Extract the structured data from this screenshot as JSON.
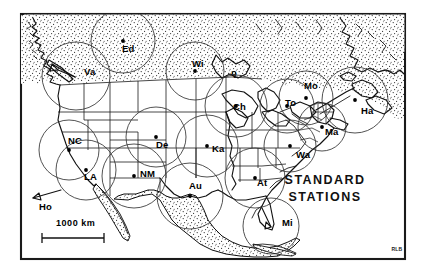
{
  "figure": {
    "title": "STANDARD",
    "title_line2": "STATIONS",
    "signature": "RLB",
    "scale_label": "1000 km",
    "offmap_label": "Ho",
    "canada_marker_label": "Q"
  },
  "chart_data": {
    "type": "scatter",
    "title": "STANDARD STATIONS",
    "xlabel": "",
    "ylabel": "",
    "projection": "North America, stippled = outside United States",
    "annotations": [
      "STANDARD",
      "STATIONS",
      "1000 km",
      "Ho",
      "RLB"
    ],
    "legend": [],
    "grid": false,
    "marker_note": "Each station is a filled dot with a circle of equal radius drawn around it (coverage radius ~ 500 km).",
    "categories": [
      "Va",
      "Ed",
      "Wi",
      "Mo",
      "To",
      "Ha",
      "Ma",
      "Ch",
      "NC",
      "De",
      "Ka",
      "Wa",
      "LA",
      "NM",
      "Au",
      "At",
      "Mi",
      "Ho"
    ],
    "stations": [
      {
        "code": "Va",
        "x": 76,
        "y": 76,
        "label_dx": 8,
        "label_dy": -1,
        "circle_r": 34,
        "has_dot": false,
        "has_arrow": true
      },
      {
        "code": "Ed",
        "x": 123,
        "y": 41,
        "label_dx": -1,
        "label_dy": 11,
        "circle_r": 32,
        "has_dot": true,
        "has_arrow": false
      },
      {
        "code": "Wi",
        "x": 195,
        "y": 71,
        "label_dx": -3,
        "label_dy": -4,
        "circle_r": 29,
        "has_dot": true,
        "has_arrow": false
      },
      {
        "code": "Mo",
        "x": 306,
        "y": 98,
        "label_dx": -2,
        "label_dy": -9,
        "circle_r": 27,
        "has_dot": true,
        "has_arrow": false
      },
      {
        "code": "To",
        "x": 287,
        "y": 106,
        "label_dx": -2,
        "label_dy": 0,
        "circle_r": 27,
        "has_dot": true,
        "has_arrow": false
      },
      {
        "code": "Ha",
        "x": 355,
        "y": 100,
        "label_dx": 6,
        "label_dy": 14,
        "circle_r": 33,
        "has_dot": true,
        "has_arrow": false
      },
      {
        "code": "Ma",
        "x": 322,
        "y": 127,
        "label_dx": 3,
        "label_dy": 8,
        "circle_r": 24,
        "has_dot": true,
        "has_arrow": false
      },
      {
        "code": "Ch",
        "x": 236,
        "y": 106,
        "label_dx": -3,
        "label_dy": 4,
        "circle_r": 31,
        "has_dot": true,
        "has_arrow": false
      },
      {
        "code": "NC",
        "x": 69,
        "y": 150,
        "label_dx": -1,
        "label_dy": -6,
        "circle_r": 30,
        "has_dot": true,
        "has_arrow": false
      },
      {
        "code": "De",
        "x": 156,
        "y": 137,
        "label_dx": 0,
        "label_dy": 11,
        "circle_r": 30,
        "has_dot": true,
        "has_arrow": false
      },
      {
        "code": "Ka",
        "x": 207,
        "y": 146,
        "label_dx": 5,
        "label_dy": 6,
        "circle_r": 31,
        "has_dot": true,
        "has_arrow": false
      },
      {
        "code": "Wa",
        "x": 290,
        "y": 146,
        "label_dx": 6,
        "label_dy": 12,
        "circle_r": 26,
        "has_dot": true,
        "has_arrow": false
      },
      {
        "code": "LA",
        "x": 86,
        "y": 170,
        "label_dx": -2,
        "label_dy": 10,
        "circle_r": 30,
        "has_dot": true,
        "has_arrow": false
      },
      {
        "code": "NM",
        "x": 134,
        "y": 176,
        "label_dx": 6,
        "label_dy": 1,
        "circle_r": 32,
        "has_dot": true,
        "has_arrow": false
      },
      {
        "code": "Au",
        "x": 190,
        "y": 196,
        "label_dx": -1,
        "label_dy": -7,
        "circle_r": 33,
        "has_dot": true,
        "has_arrow": false
      },
      {
        "code": "At",
        "x": 255,
        "y": 178,
        "label_dx": 2,
        "label_dy": 8,
        "circle_r": 30,
        "has_dot": true,
        "has_arrow": false
      },
      {
        "code": "Mi",
        "x": 271,
        "y": 226,
        "label_dx": 11,
        "label_dy": 0,
        "circle_r": 28,
        "has_dot": false,
        "has_arrow": true
      },
      {
        "code": "Ho",
        "x": 38,
        "y": 201,
        "label_dx": 0,
        "label_dy": 0,
        "circle_r": 0,
        "has_dot": false,
        "has_arrow": true
      }
    ]
  }
}
